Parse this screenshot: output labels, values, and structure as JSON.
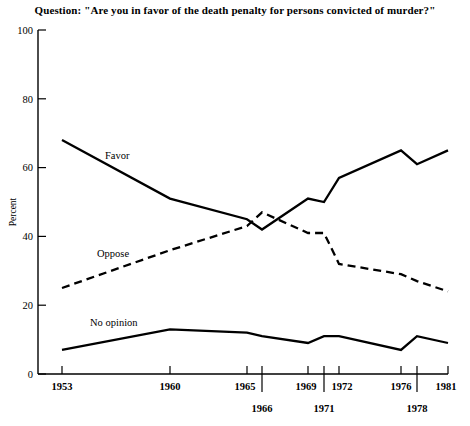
{
  "title": "Question: \"Are you in favor of the death penalty for persons convicted of murder?\"",
  "axis": {
    "ylabel": "Percent",
    "yticks": [
      "0",
      "20",
      "40",
      "60",
      "80",
      "100"
    ],
    "xticks_upper": [
      "1953",
      "1960",
      "1965",
      "1969",
      "1972",
      "1976",
      "1981"
    ],
    "xticks_lower": [
      "1966",
      "1971",
      "1978"
    ]
  },
  "series_labels": {
    "favor": "Favor",
    "oppose": "Oppose",
    "no_opinion": "No opinion"
  },
  "colors": {
    "ink": "#000000",
    "background": "#ffffff"
  },
  "chart_data": {
    "type": "line",
    "title": "Question: \"Are you in favor of the death penalty for persons convicted of murder?\"",
    "xlabel": "",
    "ylabel": "Percent",
    "ylim": [
      0,
      100
    ],
    "xlim": [
      1953,
      1981
    ],
    "grid": false,
    "legend": "inline-labels",
    "x": [
      1953,
      1960,
      1965,
      1966,
      1969,
      1971,
      1972,
      1976,
      1978,
      1981
    ],
    "series": [
      {
        "name": "Favor",
        "style": "solid",
        "values": [
          68,
          51,
          45,
          42,
          51,
          50,
          57,
          65,
          61,
          65
        ]
      },
      {
        "name": "Oppose",
        "style": "dashed",
        "values": [
          25,
          36,
          43,
          47,
          41,
          41,
          32,
          29,
          27,
          24
        ]
      },
      {
        "name": "No opinion",
        "style": "solid",
        "values": [
          7,
          13,
          12,
          11,
          9,
          11,
          11,
          7,
          11,
          9
        ]
      }
    ]
  }
}
